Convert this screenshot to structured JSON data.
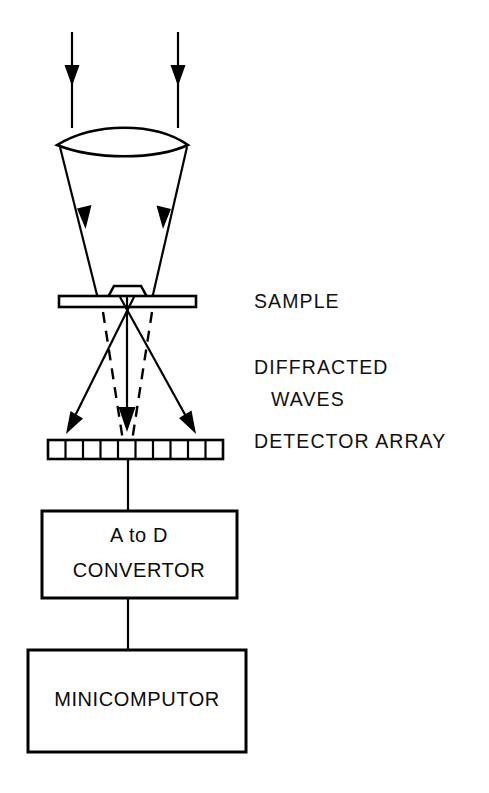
{
  "figure": {
    "kind": "optical-diffraction-schematic",
    "orientation": "vertical-top-to-bottom",
    "background_color": "#ffffff",
    "line_color": "#000000"
  },
  "labels": {
    "sample": "SAMPLE",
    "diffracted": "DIFFRACTED",
    "waves": "WAVES",
    "detector_array": "DETECTOR ARRAY"
  },
  "boxes": {
    "adc": {
      "line1": "A to D",
      "line2": "CONVERTOR"
    },
    "computer": {
      "line1": "MINICOMPUTOR"
    }
  },
  "components": {
    "incident_beam": {
      "name": "incident-beam",
      "ray_count": 2,
      "direction": "downward"
    },
    "lens": {
      "name": "converging-lens",
      "shape": "biconvex"
    },
    "converging_beam": {
      "name": "converging-beam",
      "ray_count": 2,
      "direction": "downward-inward"
    },
    "sample_stage": {
      "name": "sample-stage",
      "shape": "flat-bar-with-trapezoid-specimen"
    },
    "diffracted_rays": {
      "name": "diffracted-rays",
      "solid_ray_count": 3,
      "dashed_ray_count": 2,
      "orders": [
        "minus-one",
        "zero",
        "plus-one"
      ]
    },
    "detector": {
      "name": "detector-array",
      "cell_count": 10
    },
    "signal_lines": {
      "detector_to_adc": true,
      "adc_to_computer": true
    }
  }
}
